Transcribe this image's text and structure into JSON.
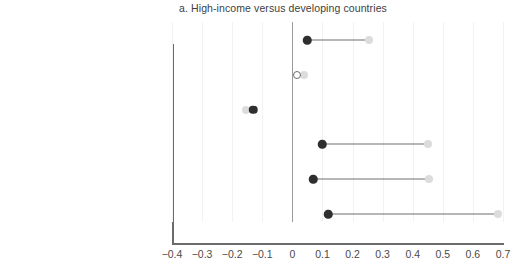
{
  "chart_data": {
    "type": "scatter",
    "title": "a. High-income versus developing countries",
    "xlabel": "",
    "ylabel": "",
    "xlim": [
      -0.4,
      0.7
    ],
    "xticks": [
      "−0.4",
      "−0.3",
      "−0.2",
      "−0.1",
      "0",
      "0.1",
      "0.2",
      "0.3",
      "0.4",
      "0.5",
      "0.6",
      "0.7"
    ],
    "xtick_values": [
      -0.4,
      -0.3,
      -0.2,
      -0.1,
      0,
      0.1,
      0.2,
      0.3,
      0.4,
      0.5,
      0.6,
      0.7
    ],
    "grid": true,
    "legend": "none",
    "categories": [
      "Labor productivity growth",
      "Sales growth",
      "Employment growth",
      "Labor productivity",
      "Wage rate",
      "Total factor productivity"
    ],
    "series": [
      {
        "name": "High-income",
        "marker": "filled-dark",
        "color": "#2f2f2f",
        "values": [
          0.05,
          0.015,
          -0.13,
          0.1,
          0.07,
          0.12
        ],
        "markers": [
          "filled",
          "hollow",
          "filled",
          "filled",
          "filled",
          "filled"
        ]
      },
      {
        "name": "Developing",
        "marker": "filled-light",
        "color": "#dcdcdc",
        "values": [
          0.255,
          0.04,
          -0.155,
          0.45,
          0.455,
          0.685
        ]
      }
    ],
    "connector_color": "#6e6e6e",
    "zero_line_color": "#9b9b9b",
    "axis_color": "#6b6b6b",
    "gridline_color": "#f2f2f2"
  }
}
